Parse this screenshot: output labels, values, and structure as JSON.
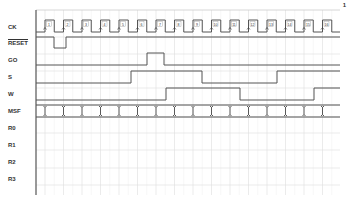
{
  "page_number": "1",
  "signals": [
    {
      "name": "CK",
      "y": 27,
      "overline": false
    },
    {
      "name": "RESET",
      "y": 43,
      "overline": true
    },
    {
      "name": "GO",
      "y": 60,
      "overline": false
    },
    {
      "name": "S",
      "y": 77,
      "overline": false
    },
    {
      "name": "W",
      "y": 94,
      "overline": false
    },
    {
      "name": "MSF",
      "y": 111,
      "overline": false
    },
    {
      "name": "R0",
      "y": 128,
      "overline": false
    },
    {
      "name": "R1",
      "y": 145,
      "overline": false
    },
    {
      "name": "R2",
      "y": 162,
      "overline": false
    },
    {
      "name": "R3",
      "y": 179,
      "overline": false
    }
  ],
  "clock": {
    "cycles": [
      "1",
      "2",
      "3",
      "4",
      "5",
      "6",
      "7",
      "8",
      "9",
      "10",
      "11",
      "12",
      "13",
      "14",
      "15",
      "16"
    ],
    "first_rise_x": 45,
    "period": 18.5,
    "end_x": 340,
    "high_y": 20,
    "low_y": 32
  },
  "grid": {
    "left_x": 36,
    "right_x": 340,
    "top_y": 10,
    "bottom_y": 195,
    "h_lines": [
      37,
      54,
      71,
      88,
      105,
      117,
      133,
      150,
      168,
      185
    ],
    "color": "#dddddd",
    "axis_color": "#555555",
    "trace_color": "#555555"
  },
  "waveforms": {
    "RESET": {
      "high_y": 37,
      "low_y": 48,
      "segments": [
        [
          36,
          "H"
        ],
        [
          54,
          "L"
        ],
        [
          66,
          "H"
        ],
        [
          340,
          "H"
        ]
      ]
    },
    "GO": {
      "high_y": 53,
      "low_y": 65,
      "segments": [
        [
          36,
          "L"
        ],
        [
          147,
          "H"
        ],
        [
          164,
          "L"
        ],
        [
          340,
          "L"
        ]
      ]
    },
    "S": {
      "high_y": 71,
      "low_y": 83,
      "segments": [
        [
          36,
          "L"
        ],
        [
          131,
          "H"
        ],
        [
          202,
          "L"
        ],
        [
          277,
          "H"
        ],
        [
          340,
          "H"
        ]
      ]
    },
    "W": {
      "high_y": 88,
      "low_y": 100,
      "segments": [
        [
          36,
          "L"
        ],
        [
          166,
          "H"
        ],
        [
          240,
          "L"
        ],
        [
          314,
          "H"
        ],
        [
          340,
          "H"
        ]
      ]
    },
    "MSF": {
      "top_y": 105,
      "bottom_y": 117,
      "type": "bus"
    }
  }
}
